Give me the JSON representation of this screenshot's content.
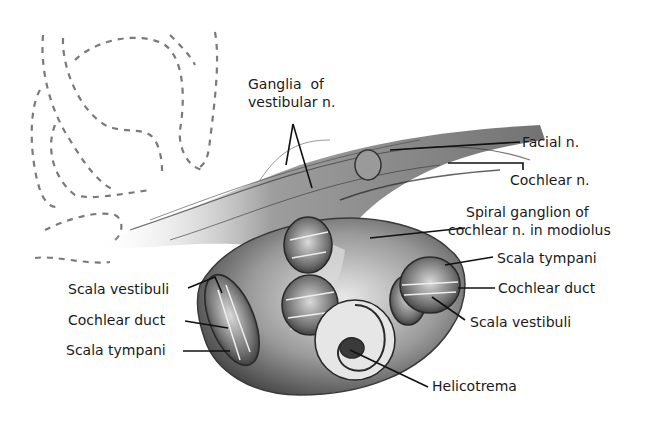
{
  "figure": {
    "labels": {
      "ganglia_vestibular_line1": "Ganglia  of",
      "ganglia_vestibular_line2": "vestibular n.",
      "facial_n": "Facial n.",
      "cochlear_n": "Cochlear n.",
      "spiral_ganglion_line1": "Spiral ganglion of",
      "spiral_ganglion_line2": "cochlear n. in modiolus",
      "scala_tympani_right": "Scala tympani",
      "cochlear_duct_right": "Cochlear duct",
      "scala_vestibuli_right": "Scala vestibuli",
      "helicotrema": "Helicotrema",
      "scala_vestibuli_left": "Scala vestibuli",
      "cochlear_duct_left": "Cochlear duct",
      "scala_tympani_left": "Scala tympani"
    },
    "colors": {
      "ink": "#1a1a1a",
      "shade_dark": "#3a3a3a",
      "shade_mid": "#8a8a8a",
      "shade_light": "#d6d6d6",
      "dashed_outline": "#7a7a7a",
      "background": "#ffffff"
    }
  }
}
